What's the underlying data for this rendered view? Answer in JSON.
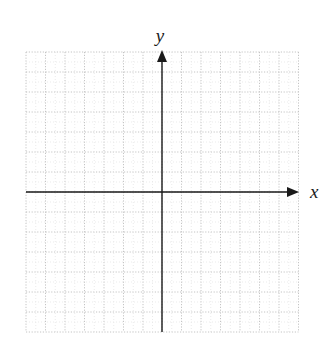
{
  "diagram": {
    "type": "coordinate-plane",
    "x_axis_label": "x",
    "y_axis_label": "y",
    "colors": {
      "axis": "#1a1a1a",
      "grid": "#c4c4c4",
      "background": "#ffffff"
    },
    "grid": {
      "style": "dotted",
      "columns_left_of_origin": 7,
      "columns_right_of_origin": 7,
      "rows_above_origin": 7,
      "rows_below_origin": 7
    },
    "layout": {
      "origin_px": [
        162,
        192
      ],
      "x_gridlines_px": [
        26,
        45.5,
        65,
        84.5,
        104,
        123.5,
        143,
        162,
        181.5,
        201,
        220.5,
        240,
        259.5,
        279,
        298.5
      ],
      "y_gridlines_px": [
        52,
        72,
        92,
        112,
        132,
        152,
        172,
        192,
        212,
        232,
        252,
        272,
        292,
        312,
        332
      ],
      "x_axis_start_px": 26,
      "x_axis_arrow_tip_px": 299,
      "y_axis_top_arrow_tip_px": 50,
      "y_axis_bottom_px": 332,
      "x_label_pos_px": [
        310,
        198
      ],
      "y_label_pos_px": [
        160,
        42
      ]
    }
  }
}
